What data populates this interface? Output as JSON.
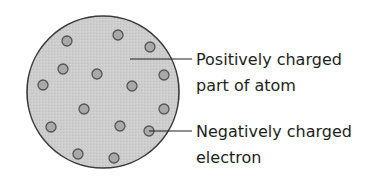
{
  "diagram": {
    "atom": {
      "cx": 103,
      "cy": 92,
      "r": 76,
      "fill": "#cfcfcf",
      "stroke": "#3a3a3a"
    },
    "electron_style": {
      "r": 5,
      "fill": "#a9a9a9",
      "stroke": "#555555"
    },
    "electrons": [
      {
        "x": 67,
        "y": 41
      },
      {
        "x": 118,
        "y": 35
      },
      {
        "x": 150,
        "y": 47
      },
      {
        "x": 63,
        "y": 69
      },
      {
        "x": 97,
        "y": 74
      },
      {
        "x": 164,
        "y": 75
      },
      {
        "x": 43,
        "y": 85
      },
      {
        "x": 132,
        "y": 86
      },
      {
        "x": 84,
        "y": 109
      },
      {
        "x": 164,
        "y": 109
      },
      {
        "x": 51,
        "y": 127
      },
      {
        "x": 120,
        "y": 126
      },
      {
        "x": 149,
        "y": 131
      },
      {
        "x": 78,
        "y": 154
      },
      {
        "x": 114,
        "y": 158
      }
    ],
    "labels": [
      {
        "line1": "Positively charged",
        "line2": "part of atom",
        "leader": {
          "x1": 130,
          "y1": 59,
          "x2": 192,
          "y2": 59
        }
      },
      {
        "line1": "Negatively charged",
        "line2": "electron",
        "leader": {
          "x1": 149,
          "y1": 131,
          "x2": 192,
          "y2": 131
        }
      }
    ]
  }
}
